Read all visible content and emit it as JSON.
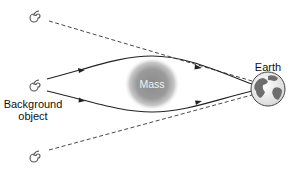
{
  "diagram": {
    "labels": {
      "earth": "Earth",
      "background_object_line1": "Background",
      "background_object_line2": "object",
      "mass": "Mass"
    },
    "nodes": [
      {
        "id": "image-top",
        "icon": "spiral-galaxy-icon",
        "kind": "apparent image"
      },
      {
        "id": "source",
        "icon": "spiral-galaxy-icon",
        "kind": "background object"
      },
      {
        "id": "image-bottom",
        "icon": "spiral-galaxy-icon",
        "kind": "apparent image"
      },
      {
        "id": "mass",
        "icon": "mass-blob",
        "kind": "lensing mass"
      },
      {
        "id": "earth",
        "icon": "earth-globe-icon",
        "kind": "observer"
      }
    ],
    "edges": [
      {
        "from": "source",
        "to": "earth",
        "style": "solid",
        "arrow": true,
        "path": "upper bent ray around mass"
      },
      {
        "from": "source",
        "to": "earth",
        "style": "solid",
        "arrow": true,
        "path": "lower bent ray around mass"
      },
      {
        "from": "image-top",
        "to": "earth",
        "style": "dashed",
        "arrow": false,
        "path": "apparent line of sight"
      },
      {
        "from": "image-bottom",
        "to": "earth",
        "style": "dashed",
        "arrow": false,
        "path": "apparent line of sight"
      }
    ],
    "colors": {
      "line": "#222222",
      "mass_center": "#8a8a8a",
      "mass_edge": "#ffffff",
      "earth_ocean": "#f4f4f4",
      "earth_land": "#6e6e6e",
      "text": "#111111"
    }
  }
}
